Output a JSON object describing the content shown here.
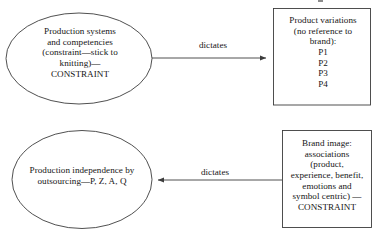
{
  "diagram": {
    "type": "flowchart",
    "background_color": "#ffffff",
    "stroke_color": "#3c3c3c",
    "text_color": "#141414",
    "nodes": [
      {
        "id": "production-systems",
        "shape": "ellipse",
        "text": "Production systems\nand competencies\n(constraint—stick to\nknitting)—\nCONSTRAINT"
      },
      {
        "id": "product-variations",
        "shape": "rectangle",
        "text": "Product variations\n(no reference to\nbrand):\nP1\nP2\nP3\nP4"
      },
      {
        "id": "production-independence",
        "shape": "ellipse",
        "text": "Production independence by\noutsourcing—P, Z, A, Q"
      },
      {
        "id": "brand-image",
        "shape": "rectangle",
        "text": "Brand image:\nassociations\n(product,\nexperience, benefit,\nemotions and\nsymbol centric) —\nCONSTRAINT"
      }
    ],
    "edges": [
      {
        "id": "edge-top",
        "label": "dictates",
        "from": "production-systems",
        "to": "product-variations",
        "direction": "right"
      },
      {
        "id": "edge-bottom",
        "label": "dictates",
        "from": "brand-image",
        "to": "production-independence",
        "direction": "left"
      }
    ]
  }
}
